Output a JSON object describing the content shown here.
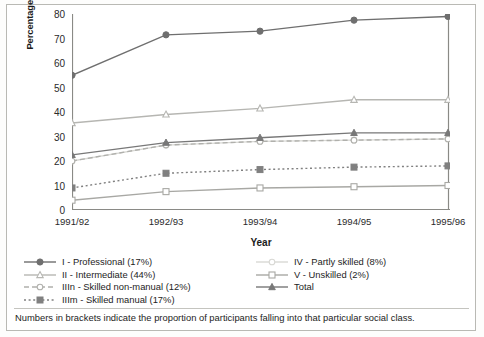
{
  "chart_data": {
    "type": "line",
    "title": "",
    "xlabel": "Year",
    "ylabel": "Percentage of young people participating in higher education",
    "categories": [
      "1991/92",
      "1992/93",
      "1993/94",
      "1994/95",
      "1995/96"
    ],
    "ylim": [
      0,
      80
    ],
    "yticks": [
      0,
      10,
      20,
      30,
      40,
      50,
      60,
      70,
      80
    ],
    "grid": false,
    "legend_position": "below-axes",
    "series": [
      {
        "name": "I - Professional (17%)",
        "key": "professional",
        "marker": "filled-circle",
        "line": "solid",
        "color": "#6f6f6f",
        "values": [
          55,
          71.5,
          73,
          77.5,
          79
        ]
      },
      {
        "name": "II - Intermediate (44%)",
        "key": "intermediate",
        "marker": "open-triangle",
        "line": "solid",
        "color": "#b6b6b2",
        "values": [
          35.5,
          39,
          41.5,
          45,
          45
        ]
      },
      {
        "name": "IIIn - Skilled non-manual (12%)",
        "key": "skilled-non-manual",
        "marker": "open-circle",
        "line": "dashed",
        "color": "#b0b0ac",
        "values": [
          20,
          26.5,
          28,
          28.5,
          29
        ]
      },
      {
        "name": "IIIm - Skilled manual (17%)",
        "key": "skilled-manual",
        "marker": "filled-square",
        "line": "dotted",
        "color": "#808080",
        "values": [
          9,
          15,
          16.5,
          17.5,
          18
        ]
      },
      {
        "name": "IV - Partly skilled (8%)",
        "key": "partly-skilled",
        "marker": "open-circle-light",
        "line": "solid",
        "color": "#d8d8d4",
        "values": [
          20,
          26.5,
          28,
          28.5,
          29
        ]
      },
      {
        "name": "V - Unskilled (2%)",
        "key": "unskilled",
        "marker": "open-square",
        "line": "solid",
        "color": "#a8a8a4",
        "values": [
          4,
          7.5,
          9,
          9.5,
          10
        ]
      },
      {
        "name": "Total",
        "key": "total",
        "marker": "filled-triangle",
        "line": "solid",
        "color": "#787878",
        "values": [
          22.5,
          27.5,
          29.5,
          31.5,
          31.5
        ]
      }
    ]
  },
  "legend": {
    "left_items": [
      "I - Professional (17%)",
      "II - Intermediate (44%)",
      "IIIn - Skilled non-manual (12%)",
      "IIIm - Skilled manual (17%)"
    ],
    "right_items": [
      "IV - Partly skilled (8%)",
      "V - Unskilled (2%)",
      "Total"
    ]
  },
  "footnote": "Numbers in brackets indicate the proportion of participants falling into that particular social class."
}
